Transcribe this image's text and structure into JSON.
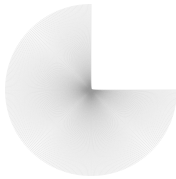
{
  "figure": {
    "type": "radial-line-burst",
    "center": [
      91,
      90
    ],
    "radius": 86,
    "start_angle_deg": 0,
    "sweep_deg": 270,
    "direction": "clockwise-screen",
    "line_count": 330,
    "line_color": "#9a9a9a",
    "line_opacity": 0.55,
    "line_width": 0.35,
    "background": "#ffffff",
    "missing_quadrant": "top-right"
  }
}
